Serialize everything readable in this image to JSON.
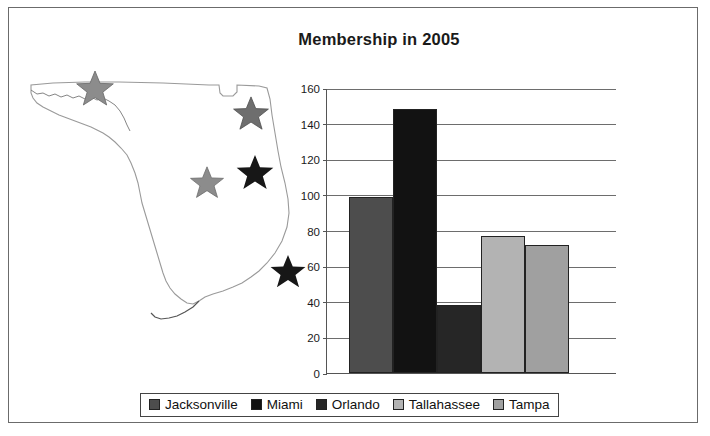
{
  "chart_data": {
    "type": "bar",
    "title": "Membership in 2005",
    "xlabel": "",
    "ylabel": "",
    "categories": [
      "Jacksonville",
      "Miami",
      "Orlando",
      "Tallahassee",
      "Tampa"
    ],
    "values": [
      99,
      148,
      38,
      77,
      72
    ],
    "ylim": [
      0,
      160
    ],
    "yticks": [
      0,
      20,
      40,
      60,
      80,
      100,
      120,
      140,
      160
    ],
    "grid": true,
    "legend_position": "bottom",
    "series": [
      {
        "name": "Membership in 2005",
        "values": [
          99,
          148,
          38,
          77,
          72
        ]
      }
    ],
    "bar_colors": [
      "#4d4d4d",
      "#121212",
      "#262626",
      "#b3b3b3",
      "#a0a0a0"
    ]
  },
  "legend": {
    "items": [
      {
        "label": "Jacksonville",
        "color": "#4d4d4d"
      },
      {
        "label": "Miami",
        "color": "#121212"
      },
      {
        "label": "Orlando",
        "color": "#262626"
      },
      {
        "label": "Tallahassee",
        "color": "#b3b3b3"
      },
      {
        "label": "Tampa",
        "color": "#a0a0a0"
      }
    ]
  },
  "map": {
    "region_name": "Florida",
    "markers": [
      {
        "city": "Tallahassee",
        "icon": "star-icon",
        "color": "#8c8c8c",
        "size": 38,
        "x": 52,
        "y": 6
      },
      {
        "city": "Jacksonville",
        "icon": "star-icon",
        "color": "#6e6e6e",
        "size": 36,
        "x": 209,
        "y": 32
      },
      {
        "city": "Orlando",
        "icon": "star-icon",
        "color": "#171717",
        "size": 38,
        "x": 212,
        "y": 90
      },
      {
        "city": "Tampa",
        "icon": "star-icon",
        "color": "#8c8c8c",
        "size": 34,
        "x": 166,
        "y": 102
      },
      {
        "city": "Miami",
        "icon": "star-icon",
        "color": "#171717",
        "size": 36,
        "x": 246,
        "y": 190
      }
    ]
  }
}
